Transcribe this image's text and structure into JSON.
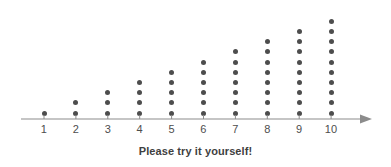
{
  "chart_data": {
    "type": "scatter",
    "plot_style": "dot-plot",
    "title": "",
    "subtitle": "",
    "caption": "Please try it yourself!",
    "xlabel": "",
    "ylabel": "",
    "categories": [
      1,
      2,
      3,
      4,
      5,
      6,
      7,
      8,
      9,
      10
    ],
    "values": [
      1,
      2,
      3,
      4,
      5,
      6,
      7,
      8,
      9,
      10
    ],
    "tick_labels": [
      "1",
      "2",
      "3",
      "4",
      "5",
      "6",
      "7",
      "8",
      "9",
      "10"
    ],
    "xlim": [
      0.5,
      11.2
    ],
    "ylim": [
      0,
      10
    ],
    "grid": false,
    "legend": null,
    "series": [
      {
        "name": "count",
        "values": [
          1,
          2,
          3,
          4,
          5,
          6,
          7,
          8,
          9,
          10
        ]
      }
    ],
    "annotations": [],
    "axis": {
      "show_x_axis_line": true,
      "x_axis_arrow_right": true,
      "x_axis_arrow_left": false,
      "show_y_axis_line": false,
      "tick_direction": "up"
    },
    "colors": {
      "dot": "#4d4d4d",
      "axis": "#8c8c8c",
      "tick_label": "#4d4d4d",
      "caption": "#3f3f3f",
      "background": "#ffffff"
    }
  },
  "geometry": {
    "baseline_y": 119,
    "x_start": 44,
    "x_step": 31.9,
    "dot_spacing_y": 10.2,
    "dot_diameter": 5,
    "axis_left": 21,
    "axis_right": 360,
    "arrow_tip_x": 372
  }
}
